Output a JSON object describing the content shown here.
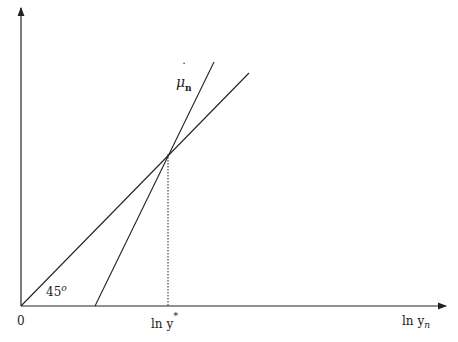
{
  "diagram": {
    "origin_label": "0",
    "x_axis_label": "ln  y",
    "x_axis_subscript": "n",
    "y_star_label": "ln  y",
    "y_star_superscript": "*",
    "angle_label": "45",
    "angle_superscript": "o",
    "curve_label": "μ",
    "curve_label_dot": "˙",
    "curve_label_subscript": "n",
    "line_color": "#222222"
  }
}
